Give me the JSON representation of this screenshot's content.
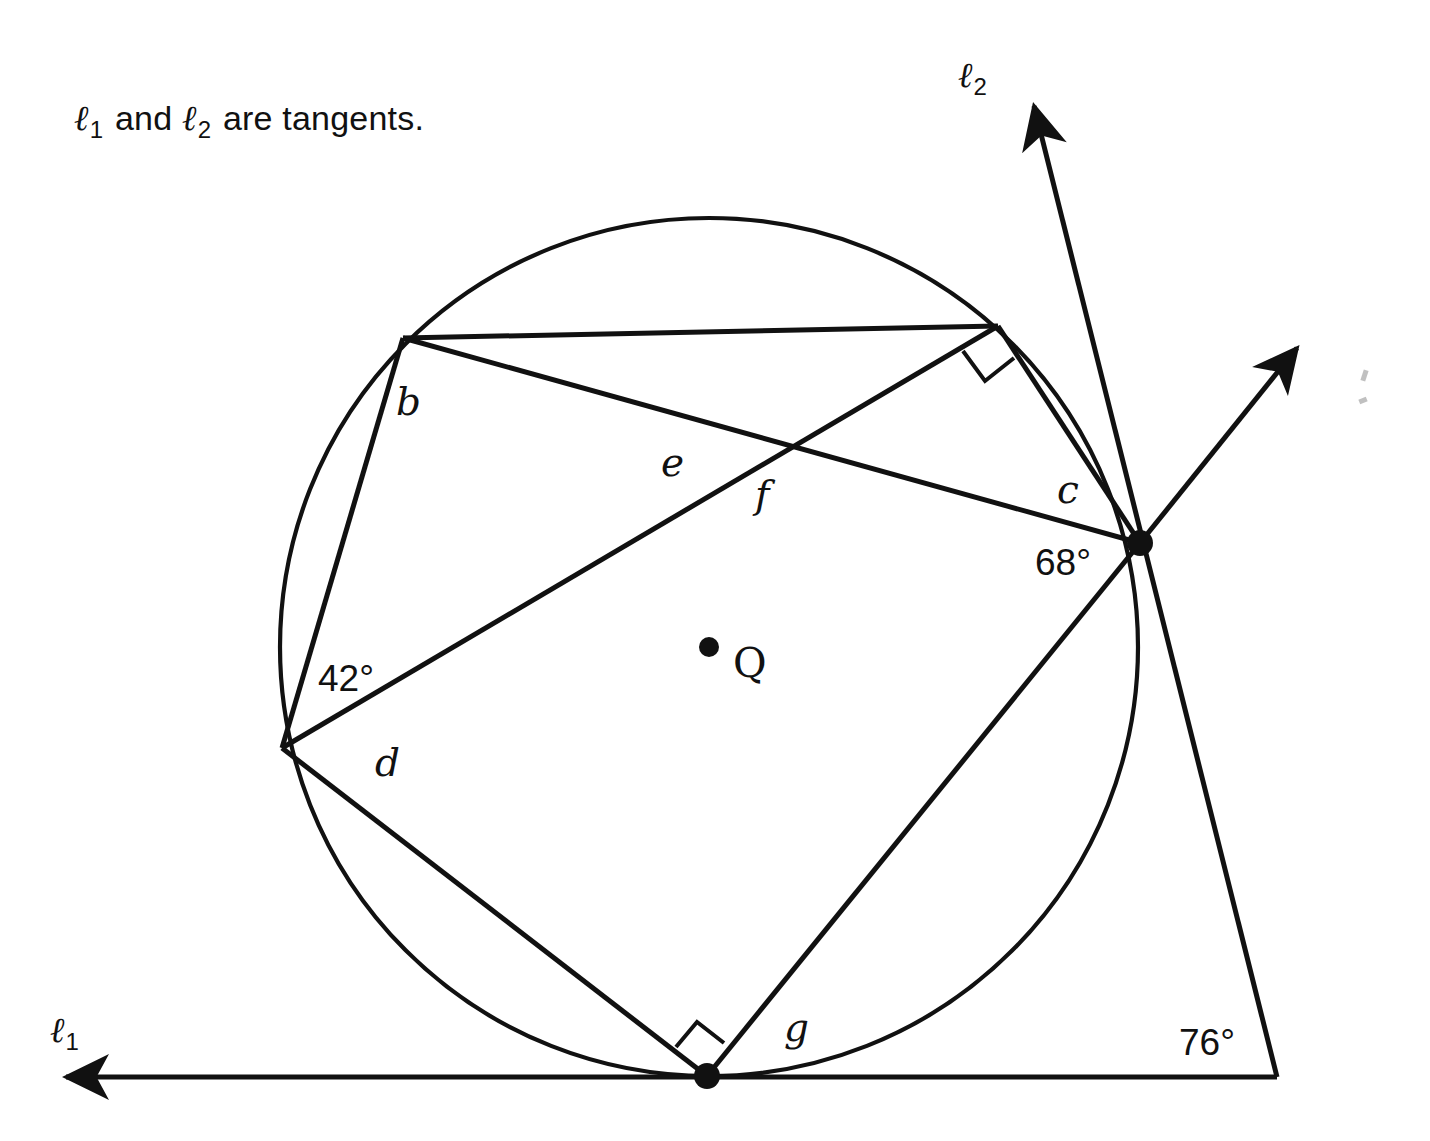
{
  "page": {
    "background": "#ffffff",
    "ink": "#111111",
    "width": 1430,
    "height": 1141
  },
  "header": {
    "prefix": "",
    "line1_symbol": "ℓ",
    "line1_sub": "1",
    "conjunction": " and ",
    "line2_symbol": "ℓ",
    "line2_sub": "2",
    "suffix": " are tangents.",
    "full_text": "ℓ1 and ℓ2 are tangents."
  },
  "diagram": {
    "type": "circle-tangent-chord-geometry",
    "circle": {
      "label": "Q",
      "center_label": "Q",
      "center": {
        "x": 709,
        "y": 647
      },
      "radius": 429,
      "stroke": "#111111",
      "stroke_width": 4
    },
    "points": [
      {
        "id": "A",
        "x": 403,
        "y": 338,
        "dot": false,
        "note": "upper-left point on circle"
      },
      {
        "id": "B",
        "x": 998,
        "y": 326,
        "dot": false,
        "note": "upper-right point on circle"
      },
      {
        "id": "C",
        "x": 1140,
        "y": 543,
        "dot": true,
        "note": "right tangency point of line 2"
      },
      {
        "id": "D",
        "x": 282,
        "y": 748,
        "dot": false,
        "note": "left point on circle"
      },
      {
        "id": "E",
        "x": 707,
        "y": 1076,
        "dot": true,
        "note": "bottom tangency point of line 1"
      },
      {
        "id": "T",
        "x": 1277,
        "y": 1077,
        "dot": false,
        "note": "intersection of the two tangents"
      },
      {
        "id": "X",
        "x": 787,
        "y": 445,
        "dot": false,
        "note": "intersection of chords AC and BD"
      },
      {
        "id": "Q",
        "x": 709,
        "y": 647,
        "dot": true,
        "note": "center of circle"
      }
    ],
    "chords": [
      {
        "from": "A",
        "to": "B"
      },
      {
        "from": "A",
        "to": "D"
      },
      {
        "from": "B",
        "to": "C"
      },
      {
        "from": "B",
        "to": "D"
      },
      {
        "from": "D",
        "to": "E"
      },
      {
        "from": "E",
        "to": "C"
      },
      {
        "from": "A",
        "to": "C"
      }
    ],
    "tangents": [
      {
        "name": "ℓ1",
        "label_symbol": "ℓ",
        "label_sub": "1",
        "label_x": 60,
        "label_y": 1035,
        "touch_point": "E",
        "from": {
          "x": 1277,
          "y": 1077
        },
        "to": {
          "x": 60,
          "y": 1077
        },
        "arrow_at": "to"
      },
      {
        "name": "ℓ2",
        "label_symbol": "ℓ",
        "label_sub": "2",
        "label_x": 966,
        "label_y": 73,
        "touch_point": "C",
        "from": {
          "x": 1277,
          "y": 1077
        },
        "to": {
          "x": 1031,
          "y": 96
        },
        "arrow_at": "to"
      }
    ],
    "rays": [
      {
        "name": "secant-ray-up-right",
        "from": {
          "x": 1140,
          "y": 543
        },
        "to": {
          "x": 1303,
          "y": 340
        },
        "arrow_at": "to"
      }
    ],
    "right_angle_marks": [
      {
        "at": "B",
        "size": 36,
        "note": "right angle between chord BD and chord BC"
      },
      {
        "at": "E",
        "size": 36,
        "note": "right angle between chord DE and chord EC"
      }
    ],
    "labels": [
      {
        "id": "label-b",
        "text": "b",
        "kind": "variable",
        "x": 396,
        "y": 382
      },
      {
        "id": "label-e",
        "text": "e",
        "kind": "variable",
        "x": 661,
        "y": 443
      },
      {
        "id": "label-f",
        "text": "f",
        "kind": "variable",
        "x": 755,
        "y": 475
      },
      {
        "id": "label-c",
        "text": "c",
        "kind": "variable",
        "x": 1057,
        "y": 470
      },
      {
        "id": "label-d",
        "text": "d",
        "kind": "variable",
        "x": 375,
        "y": 743
      },
      {
        "id": "label-g",
        "text": "g",
        "kind": "variable",
        "x": 784,
        "y": 1008
      },
      {
        "id": "label-q",
        "text": "Q",
        "kind": "point",
        "x": 733,
        "y": 643
      },
      {
        "id": "label-angle-42",
        "text": "42°",
        "kind": "angle",
        "x": 318,
        "y": 660
      },
      {
        "id": "label-angle-68",
        "text": "68°",
        "kind": "angle",
        "x": 1035,
        "y": 544
      },
      {
        "id": "label-angle-76",
        "text": "76°",
        "kind": "angle",
        "x": 1179,
        "y": 1024
      }
    ],
    "given_angles": [
      {
        "name": "42°",
        "value": 42,
        "unit": "degrees",
        "at_point": "D"
      },
      {
        "name": "68°",
        "value": 68,
        "unit": "degrees",
        "at_point": "C"
      },
      {
        "name": "76°",
        "value": 76,
        "unit": "degrees",
        "at_point": "T"
      }
    ],
    "unknown_angles": [
      "b",
      "c",
      "d",
      "e",
      "f",
      "g"
    ]
  }
}
